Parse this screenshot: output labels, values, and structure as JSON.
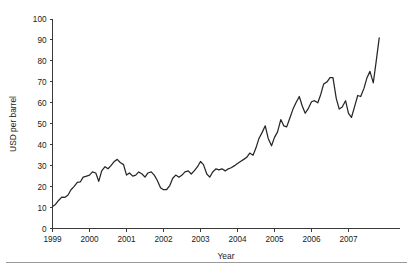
{
  "chart_data": {
    "type": "line",
    "title": "",
    "subtitle": "",
    "xlabel": "Year",
    "ylabel": "USD per barrel",
    "xlim": [
      1999.0,
      1999.0
    ],
    "ylim": [
      0,
      100
    ],
    "grid": false,
    "legend": false,
    "legend_position": "none",
    "x_tick_labels": [
      "1999",
      "2000",
      "2001",
      "2002",
      "2003",
      "2004",
      "2005",
      "2006",
      "2007"
    ],
    "x_tick_values": [
      1999,
      2000,
      2001,
      2002,
      2003,
      2004,
      2005,
      2006,
      2007
    ],
    "y_tick_labels": [
      "0",
      "10",
      "20",
      "30",
      "40",
      "50",
      "60",
      "70",
      "80",
      "90",
      "100"
    ],
    "y_tick_values": [
      0,
      10,
      20,
      30,
      40,
      50,
      60,
      70,
      80,
      90,
      100
    ],
    "x_data_range": [
      1999.0,
      1999.9
    ],
    "series": [
      {
        "name": "Crude oil price",
        "color": "#262626",
        "x": [
          1999.0,
          1999.08,
          1999.17,
          1999.25,
          1999.33,
          1999.42,
          1999.5,
          1999.58,
          1999.67,
          1999.75,
          1999.83,
          1999.92,
          2000.0,
          2000.08,
          2000.17,
          2000.25,
          2000.33,
          2000.42,
          2000.5,
          2000.58,
          2000.67,
          2000.75,
          2000.83,
          2000.92,
          2001.0,
          2001.08,
          2001.17,
          2001.25,
          2001.33,
          2001.42,
          2001.5,
          2001.58,
          2001.67,
          2001.75,
          2001.83,
          2001.92,
          2002.0,
          2002.08,
          2002.17,
          2002.25,
          2002.33,
          2002.42,
          2002.5,
          2002.58,
          2002.67,
          2002.75,
          2002.83,
          2002.92,
          2003.0,
          2003.08,
          2003.17,
          2003.25,
          2003.33,
          2003.42,
          2003.5,
          2003.58,
          2003.67,
          2003.75,
          2003.83,
          2003.92,
          2004.0,
          2004.08,
          2004.17,
          2004.25,
          2004.33,
          2004.42,
          2004.5,
          2004.58,
          2004.67,
          2004.75,
          2004.83,
          2004.92,
          2005.0,
          2005.08,
          2005.17,
          2005.25,
          2005.33,
          2005.42,
          2005.5,
          2005.58,
          2005.67,
          2005.75,
          2005.83,
          2005.92,
          2006.0,
          2006.08,
          2006.17,
          2006.25,
          2006.33,
          2006.42,
          2006.5,
          2006.58,
          2006.67,
          2006.75,
          2006.83,
          2006.92,
          2007.0,
          2007.08,
          2007.17,
          2007.25,
          2007.33,
          2007.42,
          2007.5,
          2007.58,
          2007.67,
          2007.75,
          2007.83
        ],
        "y": [
          10.5,
          11.5,
          13.5,
          15.0,
          14.8,
          16.0,
          18.5,
          20.0,
          22.0,
          22.2,
          24.5,
          25.0,
          25.5,
          27.0,
          26.5,
          22.5,
          27.5,
          29.5,
          28.5,
          30.0,
          32.0,
          33.0,
          31.5,
          30.5,
          25.5,
          26.5,
          25.0,
          25.5,
          27.0,
          26.0,
          24.5,
          26.5,
          27.0,
          25.5,
          23.0,
          19.5,
          18.5,
          18.5,
          20.5,
          24.0,
          25.5,
          24.5,
          25.5,
          27.0,
          27.5,
          26.0,
          27.5,
          29.5,
          32.0,
          30.5,
          26.0,
          24.5,
          27.0,
          28.5,
          28.0,
          28.5,
          27.5,
          28.5,
          29.0,
          30.0,
          31.0,
          32.0,
          33.0,
          34.0,
          36.0,
          35.0,
          38.5,
          43.0,
          46.0,
          49.0,
          43.0,
          39.5,
          43.5,
          46.0,
          52.0,
          49.0,
          48.5,
          53.0,
          57.0,
          60.0,
          63.0,
          58.5,
          55.0,
          57.5,
          60.5,
          61.0,
          60.0,
          64.0,
          69.0,
          70.0,
          72.0,
          72.0,
          62.0,
          57.0,
          58.0,
          61.0,
          55.0,
          53.0,
          58.5,
          63.5,
          63.0,
          67.0,
          72.0,
          75.0,
          69.5,
          80.0,
          91.0
        ]
      }
    ],
    "annotations": []
  },
  "figure": {
    "axis_titles": {
      "x": "Year",
      "y": "USD per barrel"
    },
    "footer_rule": true
  }
}
